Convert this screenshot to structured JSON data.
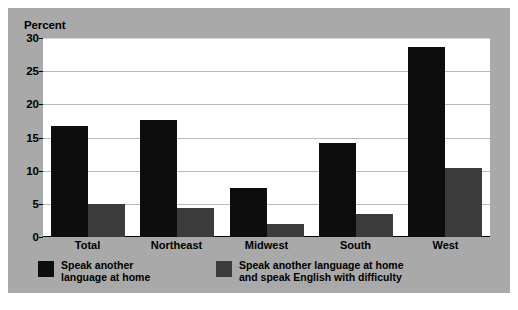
{
  "chart_data": {
    "type": "bar",
    "title": "",
    "subtitle": "",
    "ylabel": "Percent",
    "xlabel": "",
    "categories": [
      "Total",
      "Northeast",
      "Midwest",
      "South",
      "West"
    ],
    "series": [
      {
        "name": "Speak another language at home",
        "color": "#0d0d0d",
        "values": [
          16.7,
          17.6,
          7.4,
          14.1,
          28.6
        ]
      },
      {
        "name": "Speak another language at home and speak English with difficulty",
        "color": "#3b3b3b",
        "values": [
          5.0,
          4.4,
          2.0,
          3.5,
          10.4
        ]
      }
    ],
    "ylim": [
      0,
      30
    ],
    "yticks": [
      0,
      5,
      10,
      15,
      20,
      25,
      30
    ],
    "ytick_labels": [
      "0",
      "5",
      "10",
      "15",
      "20",
      "25",
      "30"
    ],
    "grid": true,
    "grid_axis": "y",
    "legend_position": "bottom",
    "legend_entries": [
      "Speak another\nlanguage at home",
      "Speak another language at home\nand speak English with difficulty"
    ]
  },
  "figure": {
    "panel_color": "#a9a9a9",
    "plot_background": "#ffffff",
    "border_color": "#ffffff",
    "gridline_color": "#b9b9b9",
    "axis_color": "#000000"
  }
}
